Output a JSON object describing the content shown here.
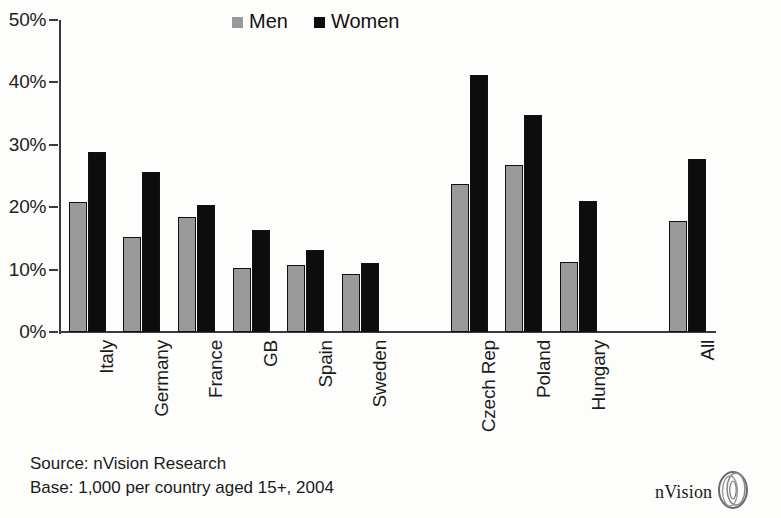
{
  "chart_data": {
    "type": "bar",
    "title": "",
    "subtitle": "",
    "xlabel": "",
    "ylabel": "",
    "ylim": [
      0,
      50
    ],
    "y_ticks": [
      "0%",
      "10%",
      "20%",
      "30%",
      "40%",
      "50%"
    ],
    "y_tick_values": [
      0,
      10,
      20,
      30,
      40,
      50
    ],
    "grid": false,
    "legend_position": "top-center",
    "value_suffix": "%",
    "categories": [
      "Italy",
      "Germany",
      "France",
      "GB",
      "Spain",
      "Sweden",
      "Czech Rep",
      "Poland",
      "Hungary",
      "All"
    ],
    "group_breaks_after": [
      "Sweden",
      "Hungary"
    ],
    "series": [
      {
        "name": "Men",
        "color": "#9a9a9a",
        "values": [
          20.8,
          15.3,
          18.5,
          10.3,
          10.8,
          9.3,
          23.7,
          26.8,
          11.3,
          17.8
        ]
      },
      {
        "name": "Women",
        "color": "#0d0d0d",
        "values": [
          28.9,
          25.7,
          20.4,
          16.3,
          13.2,
          11.1,
          41.2,
          34.8,
          21.0,
          27.8
        ]
      }
    ]
  },
  "legend": {
    "items": [
      {
        "label": "Men",
        "swatch": "men-swatch-icon"
      },
      {
        "label": "Women",
        "swatch": "women-swatch-icon"
      }
    ]
  },
  "footer": {
    "source_line": "Source: nVision Research",
    "base_line": "Base: 1,000 per country aged 15+, 2004"
  },
  "brand": {
    "name": "nVision",
    "logo_icon": "nvision-eye-logo-icon"
  },
  "colors": {
    "men": "#9a9a9a",
    "women": "#0d0d0d",
    "axis": "#3a3a3a",
    "text": "#1b1b1b",
    "background": "#fdfdfb"
  }
}
